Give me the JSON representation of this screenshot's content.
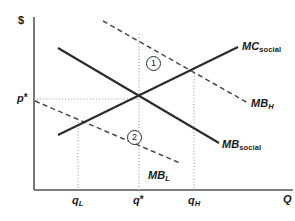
{
  "figure": {
    "type": "economics-supply-demand-diagram",
    "axes": {
      "y_axis_label": "$",
      "x_axis_label": "Q",
      "y_tick_label": "p",
      "y_tick_star": "*",
      "x_ticks": [
        {
          "base": "q",
          "sub": "L",
          "star": ""
        },
        {
          "base": "q",
          "sub": "",
          "star": "*"
        },
        {
          "base": "q",
          "sub": "H",
          "star": ""
        }
      ]
    },
    "curves": [
      {
        "id": "mc-social",
        "base": "MC",
        "sub": "social",
        "style": "solid",
        "slope": "upward"
      },
      {
        "id": "mb-social",
        "base": "MB",
        "sub": "social",
        "style": "solid",
        "slope": "downward"
      },
      {
        "id": "mb-high",
        "base": "MB",
        "sub": "H",
        "style": "dashed",
        "slope": "downward"
      },
      {
        "id": "mb-low",
        "base": "MB",
        "sub": "L",
        "style": "dashed",
        "slope": "downward"
      }
    ],
    "callouts": [
      {
        "id": "callout-1",
        "label": "1"
      },
      {
        "id": "callout-2",
        "label": "2"
      }
    ],
    "colors": {
      "ink": "#1a1a1a",
      "curve": "#2b2b2b",
      "guide": "#9a9a9a",
      "background": "#ffffff"
    }
  }
}
